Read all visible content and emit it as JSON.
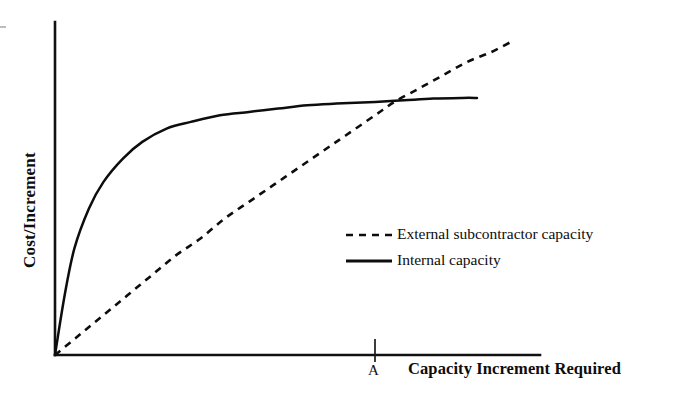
{
  "chart_data": {
    "type": "line",
    "title": "",
    "subtitle": "",
    "xlabel": "Capacity Increment Required",
    "ylabel": "Cost/Increment",
    "grid": false,
    "axis_ticks_numeric": false,
    "xlim": [
      0,
      1
    ],
    "ylim": [
      0,
      1
    ],
    "legend_position": "center-right",
    "annotations": [
      {
        "name": "crossover-tick",
        "label": "A",
        "axis": "x",
        "x": 0.66,
        "note": "tick mark on x-axis at the point where the two curves cross"
      }
    ],
    "series": [
      {
        "name": "External subcontractor capacity",
        "style": "dashed",
        "color": "#0d0d0d",
        "x": [
          0.0,
          0.05,
          0.1,
          0.15,
          0.2,
          0.25,
          0.3,
          0.35,
          0.4,
          0.45,
          0.5,
          0.55,
          0.6,
          0.66,
          0.7,
          0.75,
          0.8,
          0.85,
          0.9,
          0.94
        ],
        "y": [
          0.0,
          0.06,
          0.12,
          0.18,
          0.24,
          0.3,
          0.35,
          0.41,
          0.46,
          0.51,
          0.56,
          0.61,
          0.66,
          0.72,
          0.76,
          0.8,
          0.84,
          0.88,
          0.91,
          0.94
        ]
      },
      {
        "name": "Internal capacity",
        "style": "solid",
        "color": "#0d0d0d",
        "x": [
          0.0,
          0.02,
          0.04,
          0.07,
          0.1,
          0.14,
          0.18,
          0.23,
          0.28,
          0.34,
          0.4,
          0.46,
          0.52,
          0.58,
          0.66,
          0.72,
          0.78,
          0.84,
          0.87
        ],
        "y": [
          0.0,
          0.18,
          0.32,
          0.44,
          0.52,
          0.59,
          0.64,
          0.68,
          0.7,
          0.72,
          0.73,
          0.74,
          0.75,
          0.755,
          0.76,
          0.765,
          0.77,
          0.772,
          0.772
        ]
      }
    ],
    "crossover": {
      "x": 0.66,
      "y": 0.755,
      "label": "A"
    }
  },
  "axes": {
    "y_axis_label": "Cost/Increment",
    "x_axis_label": "Capacity Increment Required",
    "x_tick_label": "A"
  },
  "legend": {
    "entries": [
      {
        "label": "External subcontractor capacity",
        "style": "dashed"
      },
      {
        "label": "Internal capacity",
        "style": "solid"
      }
    ]
  },
  "colors": {
    "ink": "#0d0d0d",
    "background": "#ffffff"
  }
}
